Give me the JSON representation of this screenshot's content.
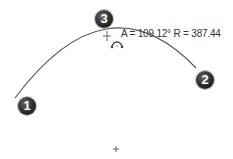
{
  "sketch": {
    "dimension_label": "A = 109.12° R = 387.44",
    "angle": "109.12°",
    "radius": "387.44",
    "points": [
      {
        "label": "1",
        "role": "arc-start"
      },
      {
        "label": "2",
        "role": "arc-end"
      },
      {
        "label": "3",
        "role": "arc-midpoint"
      }
    ],
    "icons": [
      "arc-cursor-icon",
      "center-point-icon"
    ]
  }
}
